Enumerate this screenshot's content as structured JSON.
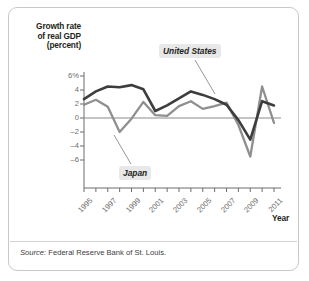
{
  "figure": {
    "source_prefix": "Source:",
    "source_text": "Federal Reserve Bank of St. Louis."
  },
  "chart_data": {
    "type": "line",
    "title": "",
    "ylabel": "Growth rate\nof real GDP\n(percent)",
    "xlabel": "Year",
    "x": [
      1995,
      1996,
      1997,
      1998,
      1999,
      2000,
      2001,
      2002,
      2003,
      2004,
      2005,
      2006,
      2007,
      2008,
      2009,
      2010,
      2011
    ],
    "xlim": [
      1995,
      2011
    ],
    "ylim": [
      -7.0,
      6.6
    ],
    "yticks": [
      6,
      4,
      2,
      0,
      -2,
      -4,
      -6
    ],
    "ytick_labels": [
      "6%",
      "4",
      "2",
      "0",
      "-2",
      "-4",
      "-6"
    ],
    "xticks": [
      1995,
      1997,
      1999,
      2001,
      2003,
      2005,
      2007,
      2009,
      2011
    ],
    "xtick_labels": [
      "1995",
      "1997",
      "1999",
      "2001",
      "2003",
      "2005",
      "2007",
      "2009",
      "2011"
    ],
    "grid": false,
    "zero_line": true,
    "legend_position": "inline-annotations",
    "series": [
      {
        "name": "United States",
        "color": "#3d3d3d",
        "values": [
          2.7,
          3.8,
          4.5,
          4.4,
          4.7,
          4.1,
          1.0,
          1.8,
          2.8,
          3.8,
          3.3,
          2.7,
          1.9,
          -0.3,
          -3.1,
          2.4,
          1.8
        ]
      },
      {
        "name": "Japan",
        "color": "#8f8f8f",
        "values": [
          1.9,
          2.6,
          1.6,
          -2.0,
          -0.1,
          2.3,
          0.4,
          0.3,
          1.7,
          2.4,
          1.3,
          1.7,
          2.2,
          -1.0,
          -5.5,
          4.5,
          -0.7
        ]
      }
    ],
    "annotations": [
      {
        "text": "United States",
        "series": "United States"
      },
      {
        "text": "Japan",
        "series": "Japan"
      }
    ]
  }
}
